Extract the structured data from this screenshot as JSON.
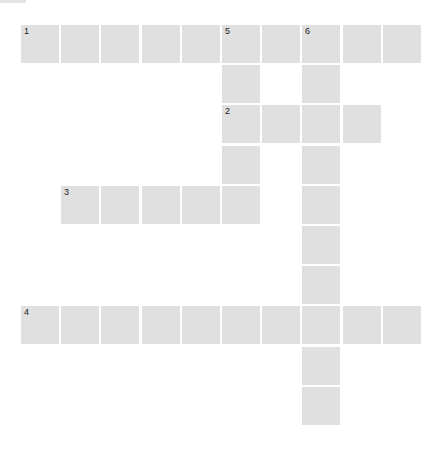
{
  "puzzle": {
    "cell_color": "#e0e0e0",
    "grid_origin": {
      "x": 21,
      "y": 25
    },
    "cell_pitch": 40.2,
    "cell_size": 38,
    "entries": [
      {
        "number": "1",
        "direction": "across",
        "row": 0,
        "col": 0,
        "length": 10
      },
      {
        "number": "2",
        "direction": "across",
        "row": 2,
        "col": 5,
        "length": 4
      },
      {
        "number": "3",
        "direction": "across",
        "row": 4,
        "col": 1,
        "length": 5
      },
      {
        "number": "4",
        "direction": "across",
        "row": 7,
        "col": 0,
        "length": 10
      },
      {
        "number": "5",
        "direction": "down",
        "row": 0,
        "col": 5,
        "length": 5
      },
      {
        "number": "6",
        "direction": "down",
        "row": 0,
        "col": 7,
        "length": 10
      }
    ]
  }
}
